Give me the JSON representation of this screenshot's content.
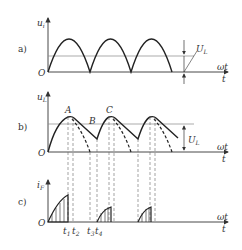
{
  "panels": {
    "a": {
      "label": "a)",
      "y_axis": "u",
      "y_sub": "i",
      "origin": "O",
      "x_label_1": "ωt",
      "x_label_2": "t",
      "level_label": "U",
      "level_sub": "L"
    },
    "b": {
      "label": "b)",
      "y_axis": "u",
      "y_sub": "L",
      "origin": "O",
      "x_label_1": "ωt",
      "x_label_2": "t",
      "level_label": "U",
      "level_sub": "L",
      "point_A": "A",
      "point_B": "B",
      "point_C": "C"
    },
    "c": {
      "label": "c)",
      "y_axis": "i",
      "y_sub": "F",
      "origin": "O",
      "x_label_1": "ωt",
      "x_label_2": "t",
      "t1": "t",
      "t1_sub": "1",
      "t2": "t",
      "t2_sub": "2",
      "t3": "t",
      "t3_sub": "3",
      "t4": "t",
      "t4_sub": "4"
    }
  },
  "colors": {
    "stroke": "#222222",
    "axis": "#333333",
    "level_line": "#777777",
    "dashed": "#666666"
  }
}
